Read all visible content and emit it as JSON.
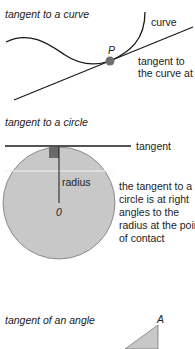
{
  "sections": {
    "curve": {
      "title": "tangent to a curve",
      "curve_label": "curve",
      "point_label": "P",
      "tangent_label_1": "tangent to",
      "tangent_label_2": "the curve at P"
    },
    "circle": {
      "title": "tangent to a circle",
      "tangent_label": "tangent",
      "radius_label": "radius",
      "center_label": "0",
      "note_lines": [
        "the tangent to a",
        "circle is at right",
        "angles to the",
        "radius at the point",
        "of contact"
      ]
    },
    "angle": {
      "title": "tangent of an angle",
      "vertex_label": "A"
    }
  },
  "colors": {
    "fill": "#c8c8c8",
    "point": "#6e6e6e",
    "right_angle": "#6a6a6a",
    "line": "#1a1a1a"
  }
}
